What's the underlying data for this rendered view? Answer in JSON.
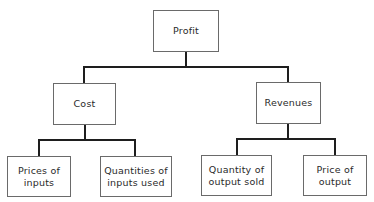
{
  "diagram": {
    "type": "tree",
    "root": {
      "label": "Profit",
      "children": [
        {
          "label": "Cost",
          "children": [
            {
              "label": "Prices of\ninputs"
            },
            {
              "label": "Quantities of\ninputs used"
            }
          ]
        },
        {
          "label": "Revenues",
          "children": [
            {
              "label": "Quantity of\noutput sold"
            },
            {
              "label": "Price of\noutput"
            }
          ]
        }
      ]
    }
  },
  "nodes": {
    "profit": "Profit",
    "cost": "Cost",
    "revenues": "Revenues",
    "prices_of_inputs": "Prices of\ninputs",
    "quantities_of_inputs_used": "Quantities of\ninputs used",
    "quantity_of_output_sold": "Quantity of\noutput sold",
    "price_of_output": "Price of\noutput"
  },
  "colors": {
    "line": "#1e1e1e",
    "box_border": "#6a6a6a",
    "text": "#2a2a2a",
    "background": "#ffffff"
  }
}
